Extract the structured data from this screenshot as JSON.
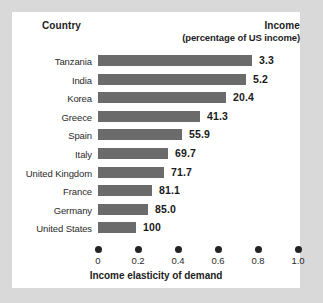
{
  "header": {
    "country_label": "Country",
    "income_label": "Income",
    "income_sublabel": "(percentage of US income)"
  },
  "axis": {
    "title": "Income elasticity of demand",
    "ticks": [
      "0",
      "0.2",
      "0.4",
      "0.6",
      "0.8",
      "1.0"
    ]
  },
  "colors": {
    "bar": "#6b6b6b",
    "text": "#1a1a1a",
    "card": "#ffffff",
    "page": "#d9d9d9"
  },
  "chart_data": {
    "type": "bar",
    "orientation": "horizontal",
    "title": "",
    "xlabel": "Income elasticity of demand",
    "ylabel": "Country",
    "xlim": [
      0,
      1.0
    ],
    "grid": false,
    "legend": null,
    "xticks": [
      0,
      0.2,
      0.4,
      0.6,
      0.8,
      1.0
    ],
    "xticklabels": [
      "0",
      "0.2",
      "0.4",
      "0.6",
      "0.8",
      "1.0"
    ],
    "categories": [
      "Tanzania",
      "India",
      "Korea",
      "Greece",
      "Spain",
      "Italy",
      "United Kingdom",
      "France",
      "Germany",
      "United States"
    ],
    "values": [
      0.77,
      0.74,
      0.64,
      0.51,
      0.42,
      0.35,
      0.33,
      0.27,
      0.25,
      0.19
    ],
    "annotations": {
      "name": "Income (percentage of US income)",
      "values": [
        "3.3",
        "5.2",
        "20.4",
        "41.3",
        "55.9",
        "69.7",
        "71.7",
        "81.1",
        "85.0",
        "100"
      ]
    }
  }
}
